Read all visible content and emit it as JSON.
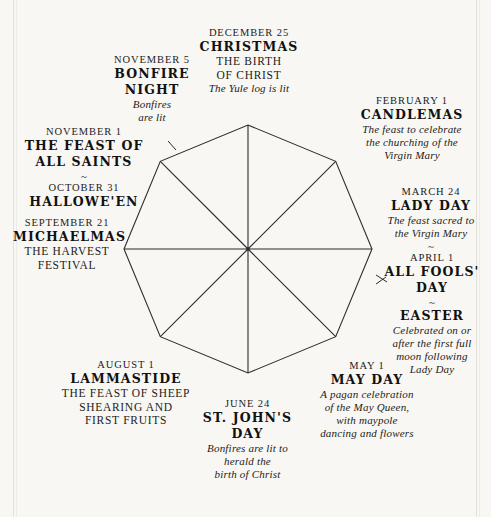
{
  "diagram": {
    "shape": "octagon",
    "center": {
      "x": 248,
      "y": 249
    },
    "radius": 124,
    "stroke_color": "#2b2b2b",
    "background_color": "#f8f7f3",
    "spokes": 8,
    "tick_marks": 2
  },
  "nodes": [
    {
      "id": "christmas",
      "date": "DECEMBER 25",
      "title": "CHRISTMAS",
      "sub_lines": [
        "THE BIRTH",
        "OF CHRIST"
      ],
      "desc_lines": [
        "The Yule log is lit"
      ],
      "tilde": "",
      "alt_date": "",
      "alt_title": ""
    },
    {
      "id": "candlemas",
      "date": "FEBRUARY 1",
      "title": "CANDLEMAS",
      "sub_lines": [],
      "desc_lines": [
        "The feast to celebrate",
        "the churching of the",
        "Virgin Mary"
      ],
      "tilde": "",
      "alt_date": "",
      "alt_title": ""
    },
    {
      "id": "lady-day",
      "date": "MARCH 24",
      "title": "LADY DAY",
      "sub_lines": [],
      "desc_lines": [
        "The feast sacred to",
        "the Virgin Mary"
      ],
      "tilde": "~",
      "alt_date": "APRIL 1",
      "alt_title": "ALL FOOLS' DAY"
    },
    {
      "id": "easter",
      "date": "",
      "title": "EASTER",
      "sub_lines": [],
      "desc_lines": [
        "Celebrated on or",
        "after the first full",
        "moon following",
        "Lady Day"
      ],
      "tilde": "~",
      "alt_date": "",
      "alt_title": ""
    },
    {
      "id": "may-day",
      "date": "MAY 1",
      "title": "MAY DAY",
      "sub_lines": [],
      "desc_lines": [
        "A pagan celebration",
        "of the May Queen,",
        "with maypole",
        "dancing and flowers"
      ],
      "tilde": "",
      "alt_date": "",
      "alt_title": ""
    },
    {
      "id": "st-johns-day",
      "date": "JUNE 24",
      "title_lines": [
        "ST. JOHN'S",
        "DAY"
      ],
      "title": "ST. JOHN'S DAY",
      "sub_lines": [],
      "desc_lines": [
        "Bonfires are lit to",
        "herald the",
        "birth of Christ"
      ],
      "tilde": "",
      "alt_date": "",
      "alt_title": ""
    },
    {
      "id": "lammastide",
      "date": "AUGUST 1",
      "title": "LAMMASTIDE",
      "sub_lines": [
        "THE FEAST OF SHEEP",
        "SHEARING AND",
        "FIRST FRUITS"
      ],
      "desc_lines": [],
      "tilde": "",
      "alt_date": "",
      "alt_title": ""
    },
    {
      "id": "michaelmas",
      "date": "SEPTEMBER 21",
      "title": "MICHAELMAS",
      "sub_lines": [
        "THE HARVEST",
        "FESTIVAL"
      ],
      "desc_lines": [],
      "tilde": "",
      "alt_date": "",
      "alt_title": ""
    },
    {
      "id": "all-saints",
      "date": "NOVEMBER 1",
      "title_lines": [
        "THE FEAST OF",
        "ALL SAINTS"
      ],
      "title": "THE FEAST OF ALL SAINTS",
      "sub_lines": [],
      "desc_lines": [],
      "tilde": "~",
      "alt_date": "OCTOBER 31",
      "alt_title": "HALLOWE'EN"
    },
    {
      "id": "bonfire-night",
      "date": "NOVEMBER 5",
      "title_lines": [
        "BONFIRE",
        "NIGHT"
      ],
      "title": "BONFIRE NIGHT",
      "sub_lines": [],
      "desc_lines": [
        "Bonfires",
        "are lit"
      ],
      "tilde": "",
      "alt_date": "",
      "alt_title": ""
    }
  ],
  "text": {
    "christmas": {
      "date": "DECEMBER 25",
      "title": "CHRISTMAS",
      "sub1": "THE BIRTH",
      "sub2": "OF CHRIST",
      "desc1": "The Yule log is lit"
    },
    "bonfire": {
      "date": "NOVEMBER 5",
      "title1": "BONFIRE",
      "title2": "NIGHT",
      "desc1": "Bonfires",
      "desc2": "are lit"
    },
    "allsaints": {
      "date": "NOVEMBER 1",
      "title1": "THE FEAST OF",
      "title2": "ALL SAINTS",
      "tilde": "~",
      "date2": "OCTOBER 31",
      "title3": "HALLOWE'EN"
    },
    "michaelmas": {
      "date": "SEPTEMBER 21",
      "title": "MICHAELMAS",
      "sub1": "THE HARVEST",
      "sub2": "FESTIVAL"
    },
    "lammastide": {
      "date": "AUGUST 1",
      "title": "LAMMASTIDE",
      "sub1": "THE FEAST OF SHEEP",
      "sub2": "SHEARING AND",
      "sub3": "FIRST FRUITS"
    },
    "stjohns": {
      "date": "JUNE 24",
      "title1": "ST. JOHN'S",
      "title2": "DAY",
      "desc1": "Bonfires are lit to",
      "desc2": "herald the",
      "desc3": "birth of Christ"
    },
    "mayday": {
      "date": "MAY 1",
      "title": "MAY DAY",
      "desc1": "A pagan celebration",
      "desc2": "of the May Queen,",
      "desc3": "with maypole",
      "desc4": "dancing and flowers"
    },
    "ladyday": {
      "date": "MARCH 24",
      "title": "LADY DAY",
      "desc1": "The feast sacred to",
      "desc2": "the Virgin Mary",
      "tilde": "~"
    },
    "allfools": {
      "date": "APRIL 1",
      "title1": "ALL FOOLS'",
      "title2": "DAY",
      "tilde": "~",
      "title3": "EASTER",
      "desc1": "Celebrated on or",
      "desc2": "after the first full",
      "desc3": "moon following",
      "desc4": "Lady Day"
    },
    "candlemas": {
      "date": "FEBRUARY 1",
      "title": "CANDLEMAS",
      "desc1": "The feast to celebrate",
      "desc2": "the churching of the",
      "desc3": "Virgin Mary"
    }
  }
}
